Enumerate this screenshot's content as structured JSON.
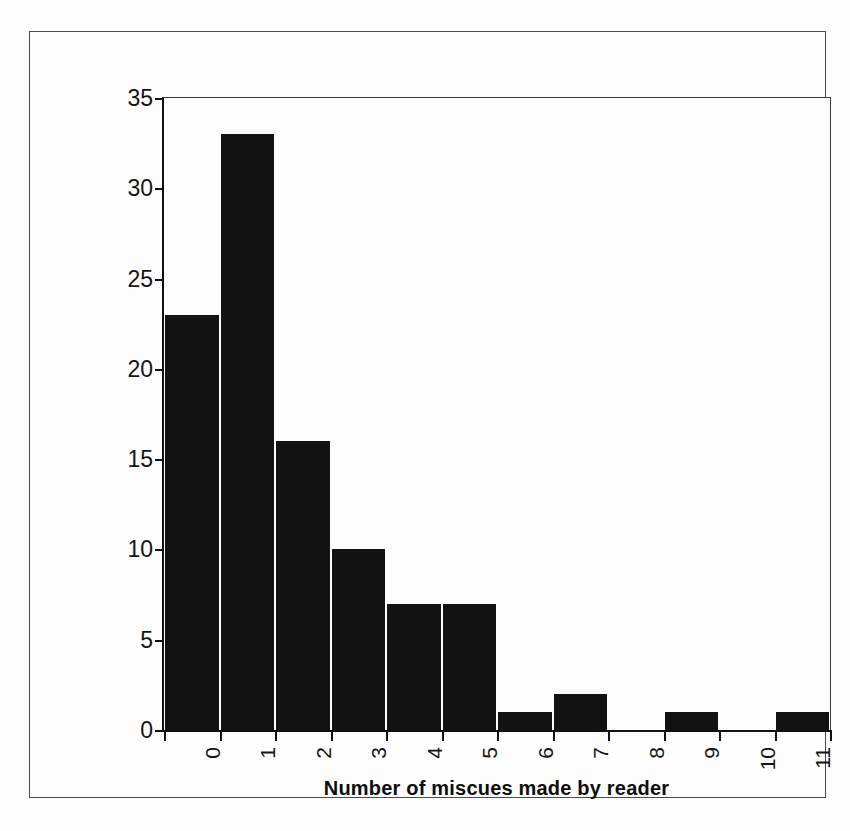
{
  "chart_data": {
    "type": "bar",
    "title": "",
    "subtitle": "",
    "xlabel": "Number of miscues made by reader",
    "ylabel": "",
    "categories": [
      "0",
      "1",
      "2",
      "3",
      "4",
      "5",
      "6",
      "7",
      "8",
      "9",
      "10",
      "11"
    ],
    "values": [
      23,
      33,
      16,
      10,
      7,
      7,
      1,
      2,
      0,
      1,
      0,
      1
    ],
    "series": [
      {
        "name": "Number of readers",
        "values": [
          23,
          33,
          16,
          10,
          7,
          7,
          1,
          2,
          0,
          1,
          0,
          1
        ]
      }
    ],
    "ylim": [
      0,
      35
    ],
    "y_ticks": [
      "0",
      "5",
      "10",
      "15",
      "20",
      "25",
      "30",
      "35"
    ],
    "y_tick_values": [
      0,
      5,
      10,
      15,
      20,
      25,
      30,
      35
    ],
    "x_tick_rotation": -90,
    "grid": false,
    "legend": false,
    "legend_position": "none",
    "bar_color": "#121212",
    "background_color": "#fdfdfd",
    "axis_color": "#111111",
    "frame": true,
    "annotations": []
  },
  "figure": {
    "outer_border_color": "#4a4a4a",
    "x_axis_title": "Number of miscues made by reader"
  }
}
